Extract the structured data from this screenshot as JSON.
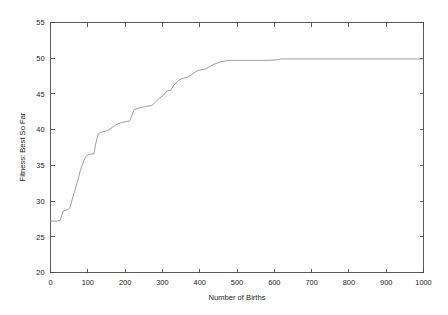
{
  "chart_data": {
    "type": "line",
    "title": "",
    "subtitle": "",
    "xlabel": "Number of Births",
    "ylabel": "Fitness: Best So Far",
    "xlim": [
      0,
      1000
    ],
    "ylim": [
      20,
      55
    ],
    "xticks": [
      0,
      100,
      200,
      300,
      400,
      500,
      600,
      700,
      800,
      900,
      1000
    ],
    "xtick_labels": [
      "0",
      "100",
      "200",
      "300",
      "400",
      "500",
      "600",
      "700",
      "800",
      "900",
      "1000"
    ],
    "yticks": [
      20,
      25,
      30,
      35,
      40,
      45,
      50,
      55
    ],
    "ytick_labels": [
      "20",
      "25",
      "30",
      "35",
      "40",
      "45",
      "50",
      "55"
    ],
    "grid": false,
    "legend": null,
    "annotations": [],
    "series": [
      {
        "name": "Best So Far",
        "color": "#8d8d8d",
        "x": [
          0,
          18,
          26,
          34,
          40,
          46,
          52,
          58,
          66,
          74,
          80,
          86,
          92,
          98,
          104,
          110,
          116,
          122,
          128,
          134,
          140,
          150,
          160,
          170,
          180,
          190,
          200,
          212,
          224,
          236,
          244,
          252,
          262,
          272,
          282,
          292,
          302,
          312,
          322,
          330,
          338,
          346,
          356,
          366,
          376,
          386,
          396,
          406,
          416,
          426,
          436,
          446,
          456,
          466,
          480,
          500,
          540,
          580,
          600,
          620,
          700,
          800,
          900,
          1000
        ],
        "y": [
          27.2,
          27.2,
          27.3,
          28.6,
          28.7,
          28.8,
          29.0,
          30.2,
          31.6,
          33.0,
          34.3,
          35.2,
          36.0,
          36.4,
          36.5,
          36.6,
          36.6,
          38.2,
          39.4,
          39.6,
          39.7,
          39.8,
          40.1,
          40.5,
          40.8,
          41.0,
          41.1,
          41.2,
          42.8,
          43.0,
          43.1,
          43.2,
          43.3,
          43.4,
          43.9,
          44.4,
          44.8,
          45.4,
          45.5,
          46.2,
          46.6,
          47.0,
          47.2,
          47.3,
          47.6,
          48.0,
          48.3,
          48.4,
          48.5,
          48.8,
          49.1,
          49.3,
          49.5,
          49.6,
          49.7,
          49.7,
          49.7,
          49.7,
          49.75,
          49.9,
          49.9,
          49.9,
          49.9,
          49.9
        ]
      }
    ]
  }
}
